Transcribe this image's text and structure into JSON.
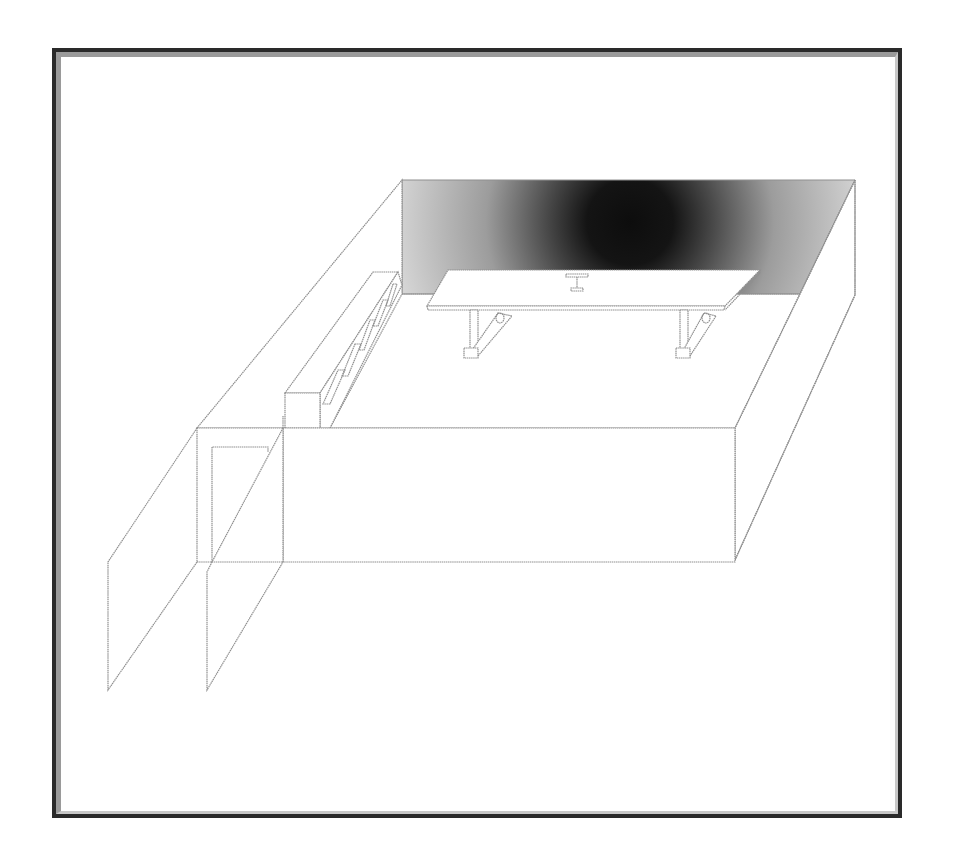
{
  "scene": {
    "type": "isometric-room-line-drawing",
    "style": {
      "line_color": "#8f8f8f",
      "frame_outer_color": "#2a2a2a",
      "frame_bevel_color": "#9a9a9a",
      "background": "#ffffff",
      "back_wall_gradient": {
        "center": [
          630,
          225
        ],
        "inner_color": "#0d0d0d",
        "outer_color": "#d8d8d8"
      }
    },
    "objects": [
      {
        "id": "back-wall",
        "label": "Back wall with dark radial shading"
      },
      {
        "id": "left-wall",
        "label": "Left side wall"
      },
      {
        "id": "right-wall",
        "label": "Right side wall"
      },
      {
        "id": "front-wall",
        "label": "Front wall"
      },
      {
        "id": "cabinet",
        "label": "Long low cabinet along left wall",
        "panel_count": 5
      },
      {
        "id": "table",
        "label": "Table with sled legs",
        "leg_count": 2
      },
      {
        "id": "table-object",
        "label": "Small T-shaped object on table"
      },
      {
        "id": "doorway",
        "label": "Doorway with open door panel"
      },
      {
        "id": "left-panels",
        "label": "Two swung-open wall panels at front-left"
      }
    ]
  }
}
